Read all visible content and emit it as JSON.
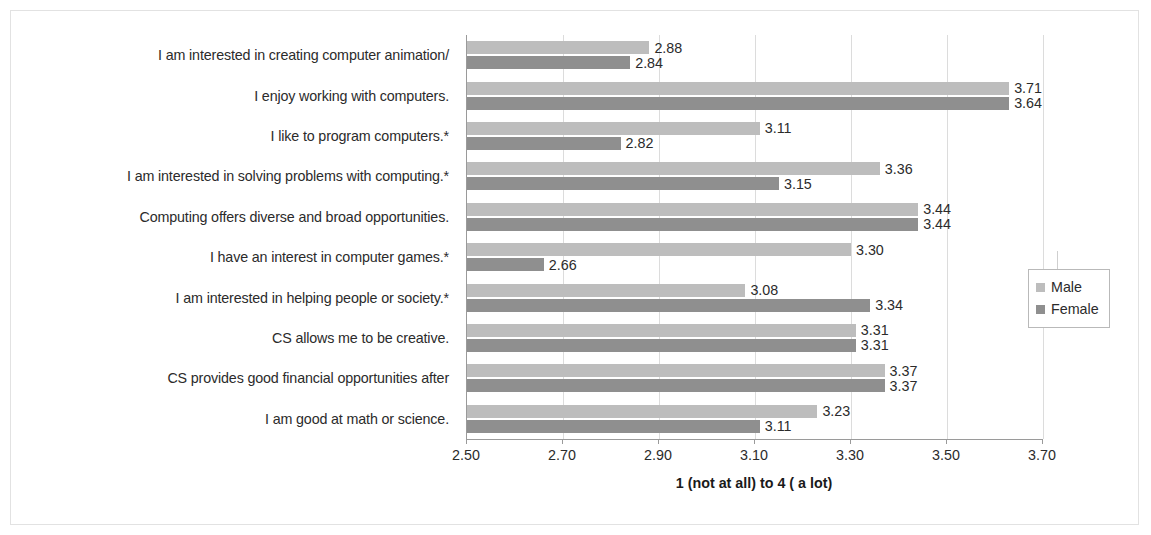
{
  "chart_data": {
    "type": "bar",
    "orientation": "horizontal",
    "title": "",
    "xlabel": "1 (not at all) to 4 ( a lot)",
    "ylabel": "",
    "xlim": [
      2.5,
      3.7
    ],
    "xticks": [
      "2.50",
      "2.70",
      "2.90",
      "3.10",
      "3.30",
      "3.50",
      "3.70"
    ],
    "xtick_values": [
      2.5,
      2.7,
      2.9,
      3.1,
      3.3,
      3.5,
      3.7
    ],
    "grid": "vertical",
    "legend_position": "right",
    "categories": [
      "I am interested in creating computer animation/",
      "I enjoy working with computers.",
      "I like to program computers.*",
      "I am interested in solving problems with computing.*",
      "Computing offers diverse and broad opportunities.",
      "I have an interest in computer games.*",
      "I am interested in helping people or society.*",
      "CS allows me to be creative.",
      "CS provides good financial opportunities after",
      "I am good at math or science."
    ],
    "series": [
      {
        "name": "Male",
        "color": "#bdbdbd",
        "values": [
          2.88,
          3.71,
          3.11,
          3.36,
          3.44,
          3.3,
          3.08,
          3.31,
          3.37,
          3.23
        ],
        "labels": [
          "2.88",
          "3.71",
          "3.11",
          "3.36",
          "3.44",
          "3.30",
          "3.08",
          "3.31",
          "3.37",
          "3.23"
        ]
      },
      {
        "name": "Female",
        "color": "#8f8f8f",
        "values": [
          2.84,
          3.64,
          2.82,
          3.15,
          3.44,
          2.66,
          3.34,
          3.31,
          3.37,
          3.11
        ],
        "labels": [
          "2.84",
          "3.64",
          "2.82",
          "3.15",
          "3.44",
          "2.66",
          "3.34",
          "3.31",
          "3.37",
          "3.11"
        ]
      }
    ]
  },
  "legend": {
    "items": [
      {
        "label": "Male",
        "swatch": "male"
      },
      {
        "label": "Female",
        "swatch": "female"
      }
    ]
  }
}
